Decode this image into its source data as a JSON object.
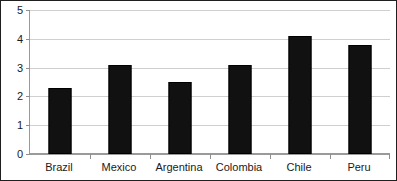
{
  "chart_data": {
    "type": "bar",
    "title": "",
    "subtitle": "",
    "xlabel": "",
    "ylabel": "",
    "categories": [
      "Brazil",
      "Mexico",
      "Argentina",
      "Colombia",
      "Chile",
      "Peru"
    ],
    "values": [
      2.3,
      3.1,
      2.5,
      3.1,
      4.1,
      3.8
    ],
    "ylim": [
      0,
      5
    ],
    "yticks": [
      0,
      1,
      2,
      3,
      4,
      5
    ],
    "ytick_labels": [
      "0",
      "1",
      "2",
      "3",
      "4",
      "5"
    ],
    "grid": true,
    "grid_axis": "y",
    "legend": false,
    "legend_position": "none",
    "annotations": [],
    "bar_color": "#111111",
    "gridline_color": "#cfcfcf",
    "axis_color": "#9a9a9a",
    "frame_color": "#1f1f1f",
    "background": "#ffffff"
  },
  "accessibility": {
    "summary": "Bar chart of six values by country: Brazil 2.3, Mexico 3.1, Argentina 2.5, Colombia 3.1, Chile 4.1, Peru 3.8."
  }
}
